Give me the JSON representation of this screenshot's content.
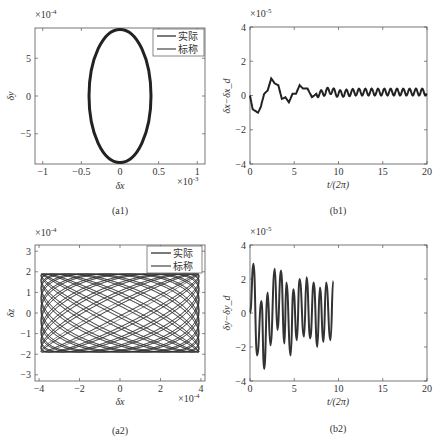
{
  "panels": {
    "a1": {
      "caption": "(a1)",
      "xlabel": "δx",
      "ylabel": "δy",
      "x_exp": "×10",
      "x_exp_pow": "-3",
      "y_exp": "×10",
      "y_exp_pow": "-4",
      "xticks": [
        "-1",
        "-0.5",
        "0",
        "0.5",
        "1"
      ],
      "yticks": [
        "5",
        "0",
        "-5"
      ],
      "legend": [
        "实际",
        "标称"
      ]
    },
    "b1": {
      "caption": "(b1)",
      "xlabel": "t/(2π)",
      "ylabel": "δx−δx_d",
      "y_exp": "×10",
      "y_exp_pow": "-5",
      "xticks": [
        "0",
        "5",
        "10",
        "15",
        "20"
      ],
      "yticks": [
        "4",
        "2",
        "0",
        "-2",
        "-4"
      ]
    },
    "a2": {
      "caption": "(a2)",
      "xlabel": "δx",
      "ylabel": "δz",
      "x_exp": "×10",
      "x_exp_pow": "-4",
      "y_exp": "×10",
      "y_exp_pow": "-4",
      "xticks": [
        "-4",
        "-2",
        "0",
        "2",
        "4"
      ],
      "yticks": [
        "3",
        "2",
        "1",
        "0",
        "-1",
        "-2",
        "-3"
      ],
      "legend": [
        "实际",
        "标称"
      ]
    },
    "b2": {
      "caption": "(b2)",
      "xlabel": "t/(2π)",
      "ylabel": "δy−δy_d",
      "y_exp": "×10",
      "y_exp_pow": "-5",
      "xticks": [
        "0",
        "5",
        "10",
        "15",
        "20"
      ],
      "yticks": [
        "4",
        "2",
        "0",
        "-2",
        "-4"
      ]
    }
  },
  "chart_data": [
    {
      "id": "a1",
      "type": "line",
      "title": "(a1)",
      "xlabel": "δx (×10^-3)",
      "ylabel": "δy (×10^-4)",
      "xlim": [
        -1.1,
        1.1
      ],
      "ylim": [
        -9,
        9
      ],
      "grid": false,
      "legend_position": "upper right",
      "series": [
        {
          "name": "实际",
          "shape": "ellipse",
          "cx": 0,
          "cy": 0,
          "rx": 0.4,
          "ry": 8.8
        },
        {
          "name": "标称",
          "shape": "ellipse",
          "cx": 0,
          "cy": 0,
          "rx": 0.4,
          "ry": 8.8
        }
      ]
    },
    {
      "id": "b1",
      "type": "line",
      "title": "(b1)",
      "xlabel": "t/(2π)",
      "ylabel": "δx−δx_d (×10^-5)",
      "xlim": [
        0,
        20
      ],
      "ylim": [
        -4,
        4
      ],
      "grid": false,
      "x": [
        0,
        0.3,
        0.6,
        0.9,
        1.2,
        1.6,
        2.0,
        2.4,
        2.8,
        3.2,
        3.6,
        4.0,
        4.4,
        4.8,
        5.2,
        5.6,
        6.0,
        6.5,
        7.0,
        7.5,
        8.0,
        9.0,
        10.0,
        12.0,
        14.0,
        16.0,
        18.0,
        20.0
      ],
      "series": [
        {
          "name": "δx−δx_d",
          "values": [
            0,
            -0.8,
            -0.9,
            -1.0,
            -0.7,
            0.1,
            0.3,
            1.0,
            0.7,
            0.6,
            -0.2,
            -0.1,
            -0.4,
            0.1,
            0.1,
            0.6,
            0.4,
            0.4,
            -0.1,
            0.1,
            0.1,
            0.3,
            0.1,
            0.2,
            0.2,
            0.2,
            0.2,
            0.2
          ],
          "oscillation_amplitude_late": 0.2
        }
      ]
    },
    {
      "id": "a2",
      "type": "line",
      "title": "(a2)",
      "xlabel": "δx (×10^-4)",
      "ylabel": "δz (×10^-4)",
      "xlim": [
        -4.2,
        4.2
      ],
      "ylim": [
        -3.3,
        3.3
      ],
      "grid": false,
      "legend_position": "upper right",
      "series": [
        {
          "name": "实际",
          "shape": "lissajous",
          "x_amplitude": 3.9,
          "z_amplitude": 1.9
        },
        {
          "name": "标称",
          "shape": "lissajous",
          "x_amplitude": 3.9,
          "z_amplitude": 1.9
        }
      ]
    },
    {
      "id": "b2",
      "type": "line",
      "title": "(b2)",
      "xlabel": "t/(2π)",
      "ylabel": "δy−δy_d (×10^-5)",
      "xlim": [
        0,
        20
      ],
      "ylim": [
        -4,
        4
      ],
      "grid": false,
      "peaks": [
        [
          0.4,
          2.9
        ],
        [
          1.3,
          0.7
        ],
        [
          2.0,
          1.2
        ],
        [
          2.8,
          2.6
        ],
        [
          3.5,
          2.5
        ],
        [
          4.1,
          1.8
        ],
        [
          4.9,
          1.4
        ],
        [
          5.6,
          2.0
        ],
        [
          6.4,
          2.1
        ],
        [
          7.2,
          1.8
        ],
        [
          7.9,
          1.5
        ],
        [
          8.6,
          1.8
        ],
        [
          9.4,
          1.9
        ],
        [
          20,
          2.0
        ]
      ],
      "troughs": [
        [
          0.8,
          -2.5
        ],
        [
          1.6,
          -3.3
        ],
        [
          2.3,
          -1.9
        ],
        [
          3.1,
          -1.0
        ],
        [
          3.9,
          -1.8
        ],
        [
          4.6,
          -2.5
        ],
        [
          5.3,
          -1.6
        ],
        [
          6.1,
          -1.4
        ],
        [
          6.8,
          -1.5
        ],
        [
          7.6,
          -2.0
        ],
        [
          8.3,
          -1.7
        ],
        [
          9.1,
          -1.6
        ],
        [
          20,
          -2.0
        ]
      ],
      "series": [
        {
          "name": "δy−δy_d",
          "late_amplitude": 1.9,
          "cycles_per_unit": 1.4
        }
      ]
    }
  ]
}
